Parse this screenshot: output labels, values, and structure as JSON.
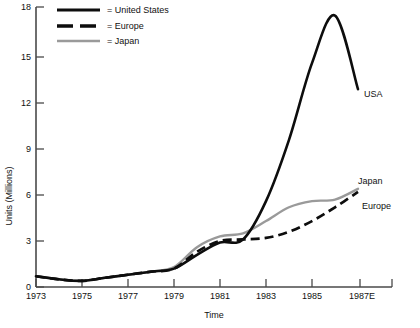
{
  "chart_data": {
    "type": "line",
    "title": "",
    "xlabel": "Time",
    "ylabel": "Units (Millions)",
    "xlim": [
      1973,
      1988
    ],
    "ylim": [
      0,
      18
    ],
    "grid": false,
    "legend_position": "top-left",
    "xticks": [
      "1973",
      "1975",
      "1977",
      "1979",
      "1981",
      "1983",
      "1985",
      "1987E"
    ],
    "xtick_values": [
      1973,
      1975,
      1977,
      1979,
      1981,
      1983,
      1985,
      1987
    ],
    "yticks": [
      "0",
      "3",
      "6",
      "9",
      "12",
      "15",
      "18"
    ],
    "ytick_values": [
      0,
      3,
      6,
      9,
      12,
      15,
      18
    ],
    "x": [
      1973,
      1974,
      1975,
      1976,
      1977,
      1978,
      1979,
      1980,
      1981,
      1982,
      1983,
      1984,
      1985,
      1986,
      1987
    ],
    "series": [
      {
        "name": "United States",
        "legend_label": "= United States",
        "end_label": "USA",
        "style": "solid",
        "color": "#0d0d0d",
        "values": [
          0.7,
          0.5,
          0.4,
          0.6,
          0.8,
          1.0,
          1.2,
          2.1,
          2.9,
          3.1,
          5.6,
          9.6,
          14.6,
          17.7,
          12.9
        ]
      },
      {
        "name": "Europe",
        "legend_label": "= Europe",
        "end_label": "Europe",
        "style": "dashed",
        "color": "#0d0d0d",
        "values": [
          0.7,
          0.5,
          0.4,
          0.6,
          0.8,
          1.0,
          1.2,
          2.3,
          3.0,
          3.1,
          3.2,
          3.6,
          4.3,
          5.2,
          6.2
        ]
      },
      {
        "name": "Japan",
        "legend_label": "= Japan",
        "end_label": "Japan",
        "style": "solid",
        "color": "#9a9a9a",
        "values": [
          0.7,
          0.5,
          0.4,
          0.6,
          0.8,
          1.0,
          1.3,
          2.6,
          3.3,
          3.5,
          4.3,
          5.2,
          5.6,
          5.7,
          6.4
        ]
      }
    ]
  },
  "legend": {
    "items": [
      {
        "label": "= United States",
        "style": "solid",
        "color": "#0d0d0d"
      },
      {
        "label": "= Europe",
        "style": "dashed",
        "color": "#0d0d0d"
      },
      {
        "label": "= Japan",
        "style": "solid",
        "color": "#9a9a9a"
      }
    ]
  },
  "annotations": {
    "usa": "USA",
    "japan": "Japan",
    "europe": "Europe"
  },
  "axes": {
    "x_title": "Time",
    "y_title": "Units (Millions)"
  }
}
